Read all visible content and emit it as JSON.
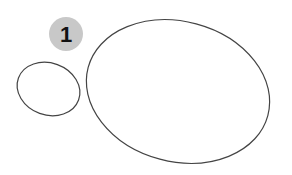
{
  "badge": {
    "label": "1",
    "fill": "#c8c8c8",
    "text_color": "#111111"
  },
  "shapes": [
    {
      "name": "small-ellipse",
      "stroke": "#444444"
    },
    {
      "name": "large-ellipse",
      "stroke": "#444444"
    }
  ]
}
